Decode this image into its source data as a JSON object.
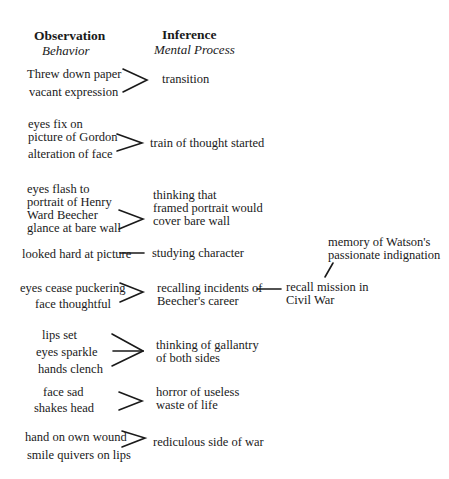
{
  "headers": {
    "observation": "Observation",
    "observation_sub": "Behavior",
    "inference": "Inference",
    "inference_sub": "Mental Process"
  },
  "rows": [
    {
      "observations": [
        "Threw down paper",
        "vacant expression"
      ],
      "inference": "transition"
    },
    {
      "observations": [
        "eyes fix on\npicture of Gordon",
        "alteration of face"
      ],
      "inference": "train of thought started"
    },
    {
      "observations": [
        "eyes flash to\nportrait of Henry\nWard Beecher",
        "glance at bare wall"
      ],
      "inference": "thinking that\nframed portrait would\ncover bare wall"
    },
    {
      "observations": [
        "looked hard at picture"
      ],
      "inference": "studying character"
    },
    {
      "observations": [
        "eyes cease puckering",
        "face thoughtful"
      ],
      "inference": "recalling incidents of\nBeecher's career",
      "further": "recall mission in\nCivil War",
      "memory": "memory of Watson's\npassionate indignation"
    },
    {
      "observations": [
        "lips set",
        "eyes sparkle",
        "hands clench"
      ],
      "inference": "thinking of gallantry\nof both sides"
    },
    {
      "observations": [
        "face sad",
        "shakes head"
      ],
      "inference": "horror of useless\nwaste of life"
    },
    {
      "observations": [
        "hand on own wound",
        "smile quivers on lips"
      ],
      "inference": "rediculous side of war"
    }
  ]
}
